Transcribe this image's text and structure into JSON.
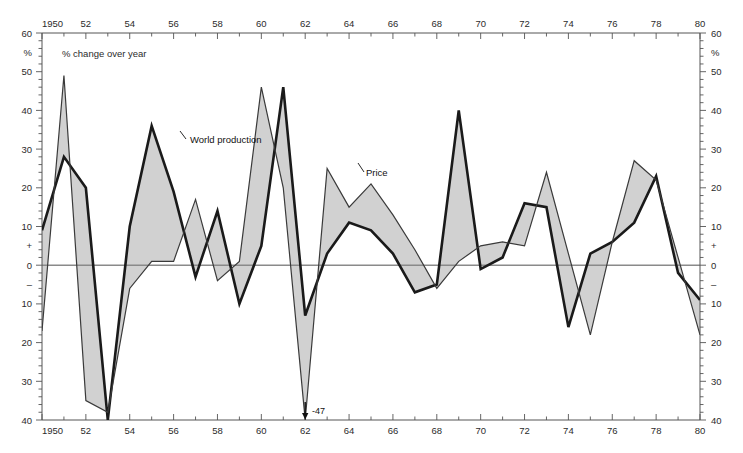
{
  "chart_data": {
    "type": "line",
    "title": "",
    "subtitle": "% change over year",
    "xlabel": "",
    "ylabel": "%",
    "xlim": [
      1950,
      1980
    ],
    "ylim": [
      -40,
      60
    ],
    "grid": false,
    "legend_position": "inline-annotations",
    "x": [
      1950,
      1951,
      1952,
      1953,
      1954,
      1955,
      1956,
      1957,
      1958,
      1959,
      1960,
      1961,
      1962,
      1963,
      1964,
      1965,
      1966,
      1967,
      1968,
      1969,
      1970,
      1971,
      1972,
      1973,
      1974,
      1975,
      1976,
      1977,
      1978,
      1979,
      1980
    ],
    "series": [
      {
        "name": "World production",
        "style": "thick",
        "color": "#1a1a1a",
        "width": 2.6,
        "values": [
          9,
          28,
          20,
          -42,
          10,
          36,
          19,
          -3,
          14,
          -10,
          5,
          46,
          -13,
          3,
          11,
          9,
          3,
          -7,
          -5,
          40,
          -1,
          2,
          16,
          15,
          -16,
          3,
          6,
          11,
          23,
          -2,
          -9
        ]
      },
      {
        "name": "Price",
        "style": "thin",
        "color": "#3a3a3a",
        "width": 1.2,
        "values": [
          -17,
          49,
          -35,
          -38,
          -6,
          1,
          1,
          17,
          -4,
          1,
          46,
          20,
          -47,
          25,
          15,
          21,
          13,
          4,
          -6,
          1,
          5,
          6,
          5,
          24,
          3,
          -18,
          6,
          27,
          22,
          2,
          -18
        ]
      }
    ],
    "fill_between": {
      "color": "#c9c9c9",
      "opacity": 0.85,
      "description": "shaded band between World production and Price"
    },
    "annotations": [
      {
        "name": "price-1962-offscale",
        "text": "-47",
        "x": 1962,
        "y": -40
      }
    ],
    "axes": {
      "top": {
        "ticks": [
          1950,
          1952,
          1954,
          1956,
          1958,
          1960,
          1962,
          1964,
          1966,
          1968,
          1970,
          1972,
          1974,
          1976,
          1978,
          1980
        ],
        "labels": [
          "1950",
          "52",
          "54",
          "56",
          "58",
          "60",
          "62",
          "64",
          "66",
          "68",
          "70",
          "72",
          "74",
          "76",
          "78",
          "80"
        ]
      },
      "bottom": {
        "ticks": [
          1950,
          1952,
          1954,
          1956,
          1958,
          1960,
          1962,
          1964,
          1966,
          1968,
          1970,
          1972,
          1974,
          1976,
          1978,
          1980
        ],
        "labels": [
          "1950",
          "52",
          "54",
          "56",
          "58",
          "60",
          "62",
          "64",
          "66",
          "68",
          "70",
          "72",
          "74",
          "76",
          "78",
          "80"
        ]
      },
      "left": {
        "ticks": [
          60,
          50,
          40,
          30,
          20,
          10,
          0,
          -10,
          -20,
          -30,
          -40
        ],
        "labels": [
          "60",
          "50",
          "40",
          "30",
          "20",
          "10",
          "0",
          "10",
          "20",
          "30",
          "40"
        ],
        "unit_label": "%",
        "plus_marker": "+",
        "minus_marker": "–"
      },
      "right": {
        "ticks": [
          60,
          50,
          40,
          30,
          20,
          10,
          0,
          -10,
          -20,
          -30,
          -40
        ],
        "labels": [
          "60",
          "50",
          "40",
          "30",
          "20",
          "10",
          "0",
          "10",
          "20",
          "30",
          "40"
        ],
        "unit_label": "%",
        "plus_marker": "+",
        "minus_marker": "–"
      },
      "minor_tick_step": 1
    }
  },
  "labels": {
    "subtitle": "% change over year",
    "world_production": "World production",
    "price": "Price",
    "annotation_47": "-47"
  },
  "colors": {
    "line_thick": "#1a1a1a",
    "line_thin": "#3a3a3a",
    "fill_band": "#c9c9c9",
    "axis": "#555555",
    "zero_line": "#8a8a8a",
    "background": "#ffffff"
  }
}
